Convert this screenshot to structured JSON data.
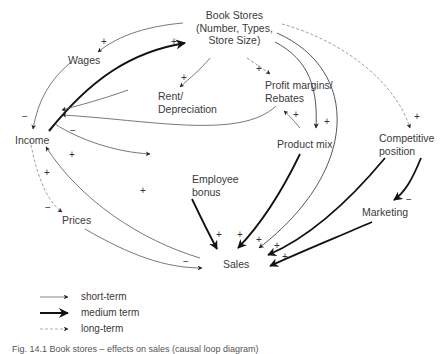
{
  "diagram": {
    "nodes": {
      "book_stores": [
        "Book Stores",
        "(Number, Types,",
        "Store Size)"
      ],
      "wages": "Wages",
      "rent": [
        "Rent/",
        "Depreciation"
      ],
      "profit": [
        "Profit margins/",
        "Rebates"
      ],
      "income": "Income",
      "product_mix": "Product mix",
      "competitive": [
        "Competitive",
        "position"
      ],
      "employee_bonus": [
        "Employee",
        "bonus"
      ],
      "prices": "Prices",
      "marketing": "Marketing",
      "sales": "Sales"
    },
    "signs": {
      "plus": "+",
      "minus": "−"
    },
    "edges": [
      {
        "from": "Book Stores",
        "to": "Wages",
        "sign": "+",
        "type": "short-term"
      },
      {
        "from": "Income",
        "to": "Book Stores",
        "sign": "+",
        "type": "medium-term"
      },
      {
        "from": "Book Stores",
        "to": "Rent/Depreciation",
        "sign": "+",
        "type": "short-term"
      },
      {
        "from": "Book Stores",
        "to": "Profit margins/Rebates",
        "sign": "+",
        "type": "long-term"
      },
      {
        "from": "Book Stores",
        "to": "Product mix",
        "sign": "+",
        "type": "short-term"
      },
      {
        "from": "Book Stores",
        "to": "Competitive position",
        "sign": "+",
        "type": "long-term"
      },
      {
        "from": "Book Stores",
        "to": "Sales",
        "sign": "+",
        "type": "short-term"
      },
      {
        "from": "Wages",
        "to": "Income",
        "sign": "−",
        "type": "short-term"
      },
      {
        "from": "Rent/Depreciation",
        "to": "Income",
        "sign": "−",
        "type": "short-term"
      },
      {
        "from": "Profit margins/Rebates",
        "to": "Income",
        "sign": "+",
        "type": "short-term"
      },
      {
        "from": "Income",
        "to": "(unlabeled)",
        "sign": "+",
        "type": "short-term"
      },
      {
        "from": "Income",
        "to": "Prices",
        "sign": "−",
        "type": "long-term"
      },
      {
        "from": "Sales",
        "to": "Income",
        "sign": "+",
        "type": "short-term"
      },
      {
        "from": "Product mix",
        "to": "Profit margins/Rebates",
        "sign": "+",
        "type": "short-term"
      },
      {
        "from": "Product mix",
        "to": "Sales",
        "sign": "+",
        "type": "medium-term"
      },
      {
        "from": "Employee bonus",
        "to": "Sales",
        "sign": "+",
        "type": "medium-term"
      },
      {
        "from": "Prices",
        "to": "Sales",
        "sign": "−",
        "type": "short-term"
      },
      {
        "from": "Competitive position",
        "to": "Sales",
        "sign": "+",
        "type": "medium-term"
      },
      {
        "from": "Competitive position",
        "to": "Marketing",
        "sign": "−",
        "type": "medium-term"
      },
      {
        "from": "Marketing",
        "to": "Sales",
        "sign": "+",
        "type": "medium-term"
      }
    ],
    "legend": [
      {
        "label": "short-term",
        "style": "thin"
      },
      {
        "label": "medium term",
        "style": "thick"
      },
      {
        "label": "long-term",
        "style": "dashed"
      }
    ],
    "caption": "Fig. 14.1 Book stores – effects on sales (causal loop diagram)"
  },
  "colors": {
    "line": "#4a4a4a",
    "thick": "#111111",
    "dashed": "#8a8a8a",
    "text": "#3a3a3a"
  }
}
